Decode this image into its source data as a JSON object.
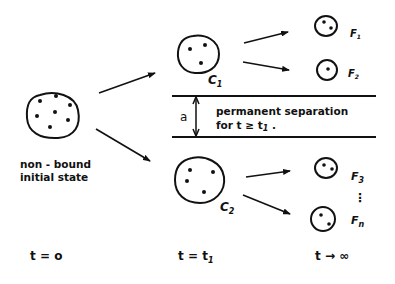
{
  "diagram": {
    "type": "cluster-decomposition schematic",
    "stroke_color": "#111111",
    "background": "#ffffff",
    "initial_state": {
      "label_line1": "non - bound",
      "label_line2": "initial state",
      "particle_count": 7
    },
    "clusters": [
      {
        "id": "C1",
        "label": "C",
        "subscript": "1",
        "particle_count": 3
      },
      {
        "id": "C2",
        "label": "C",
        "subscript": "2",
        "particle_count": 4
      }
    ],
    "fragments": [
      {
        "label": "F",
        "subscript": "1",
        "particle_count": 2
      },
      {
        "label": "F",
        "subscript": "2",
        "particle_count": 1
      },
      {
        "label": "F",
        "subscript": "3",
        "particle_count": 2
      },
      {
        "label": "F",
        "subscript": "n",
        "particle_count": 2
      }
    ],
    "ellipsis": "⋮",
    "separation": {
      "distance_label": "a",
      "text_line1": "permanent separation",
      "text_line2": "for t ≥ t",
      "text_line2_sub": "1",
      "text_line2_end": " ."
    },
    "time_axis": [
      {
        "label": "t = o"
      },
      {
        "label": "t = t",
        "subscript": "1"
      },
      {
        "label": "t → ∞"
      }
    ]
  }
}
